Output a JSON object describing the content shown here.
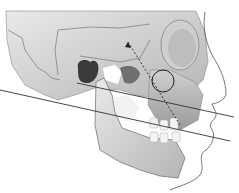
{
  "figure": {
    "reference_lines": [
      {
        "name": "upper-occlusal-reference-line",
        "from": [
          77,
          83
        ],
        "to": [
          234,
          117
        ]
      },
      {
        "name": "lower-mandibular-reference-line",
        "from": [
          0,
          90
        ],
        "to": [
          230,
          141
        ]
      }
    ],
    "markers": {
      "circle_center": [
        163,
        81
      ],
      "circle_radius": 11,
      "dashed_axis_from": [
        128,
        42
      ],
      "dashed_axis_to": [
        180,
        125
      ]
    },
    "colors": {
      "bone_light": "#e2e2e2",
      "bone_mid": "#bdbdbd",
      "bone_dark": "#7a7a7a",
      "cavity": "#3a3a3a",
      "line": "#333333",
      "profile": "#555555"
    }
  }
}
